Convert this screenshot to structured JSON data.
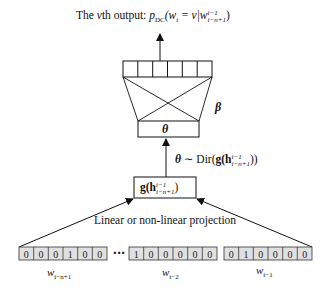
{
  "title": {
    "prefix": "The ",
    "var": "v",
    "suffix": "th output: ",
    "formula": "p",
    "formula_sub": "DC",
    "formula_body": "(w",
    "formula_body_sub": "i",
    "formula_eq": " = v|w",
    "formula_sup": "i−1",
    "formula_sub2": "i−n+1",
    "formula_close": ")"
  },
  "output_layer": {
    "cells": 6,
    "label": "output-units"
  },
  "beta_label": "β",
  "theta_box_label": "θ",
  "theta_dist": {
    "lhs": "θ",
    "op": " ∼ Dir(",
    "g": "g",
    "h": "(h",
    "sup": "i−1",
    "sub": "i−n+1",
    "close": "))"
  },
  "g_box": {
    "g": "g",
    "h": "(h",
    "sup": "i−1",
    "sub": "i−n+1",
    "close": ")"
  },
  "projection_label": "Linear or non-linear projection",
  "ellipsis": "···",
  "vectors": [
    {
      "values": [
        "0",
        "0",
        "0",
        "1",
        "0",
        "0"
      ],
      "label": "w",
      "label_sub": "i−n+1"
    },
    {
      "values": [
        "1",
        "0",
        "0",
        "0",
        "0",
        "0"
      ],
      "label": "w",
      "label_sub": "i−2"
    },
    {
      "values": [
        "0",
        "1",
        "0",
        "0",
        "0",
        "0"
      ],
      "label": "w",
      "label_sub": "i−1"
    }
  ]
}
